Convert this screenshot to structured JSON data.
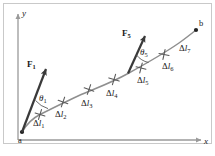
{
  "figure": {
    "type": "physics-diagram",
    "background_color": "#ffffff",
    "curve_color": "#8a8a8a",
    "arrow_color": "#3a3a3a",
    "axis_color": "#9a9a9a",
    "text_color": "#1a1a1a",
    "frame_color": "#c8c8c8",
    "axes": {
      "x_label": "x",
      "y_label": "y"
    },
    "endpoints": [
      {
        "name": "start-point",
        "label": "a",
        "x": 22,
        "y": 132
      },
      {
        "name": "end-point",
        "label": "b",
        "x": 196,
        "y": 30
      }
    ],
    "forces": [
      {
        "name": "force-vector-1",
        "label": "F",
        "sub": "1",
        "angle_label": "θ",
        "angle_sub": "1",
        "tail_x": 22,
        "tail_y": 132,
        "head_x": 47,
        "head_y": 67
      },
      {
        "name": "force-vector-5",
        "label": "F",
        "sub": "5",
        "angle_label": "θ",
        "angle_sub": "5",
        "tail_x": 128,
        "tail_y": 73,
        "head_x": 146,
        "head_y": 34
      }
    ],
    "segments": [
      {
        "name": "segment-1",
        "delta": "Δ",
        "el": "l",
        "sub": "1"
      },
      {
        "name": "segment-2",
        "delta": "Δ",
        "el": "l",
        "sub": "2"
      },
      {
        "name": "segment-3",
        "delta": "Δ",
        "el": "l",
        "sub": "3"
      },
      {
        "name": "segment-4",
        "delta": "Δ",
        "el": "l",
        "sub": "4"
      },
      {
        "name": "segment-5",
        "delta": "Δ",
        "el": "l",
        "sub": "5"
      },
      {
        "name": "segment-6",
        "delta": "Δ",
        "el": "l",
        "sub": "6"
      },
      {
        "name": "segment-7",
        "delta": "Δ",
        "el": "l",
        "sub": "7"
      }
    ],
    "tick_marks": [
      {
        "x": 40,
        "y": 115
      },
      {
        "x": 62,
        "y": 101
      },
      {
        "x": 88,
        "y": 90
      },
      {
        "x": 113,
        "y": 81
      },
      {
        "x": 140,
        "y": 70
      },
      {
        "x": 163,
        "y": 56
      },
      {
        "x": 182,
        "y": 41
      }
    ]
  }
}
